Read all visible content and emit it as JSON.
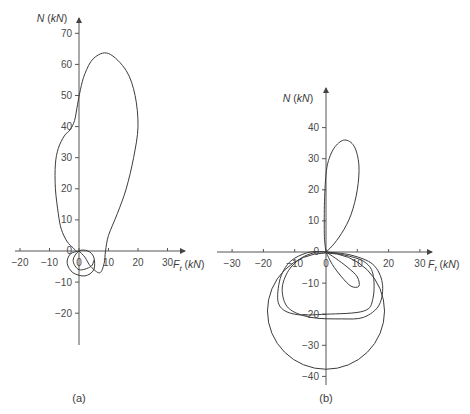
{
  "chart_data": [
    {
      "type": "line",
      "panel_label": "(a)",
      "xlabel": "F_t (kN)",
      "ylabel": "N (kN)",
      "xlim": [
        -20,
        35
      ],
      "ylim": [
        -20,
        73
      ],
      "x_ticks": [
        -20,
        -10,
        0,
        10,
        20,
        30
      ],
      "y_ticks": [
        -20,
        -10,
        10,
        20,
        30,
        40,
        50,
        60,
        70
      ],
      "grid": false,
      "origin_label": "0",
      "series": [
        {
          "name": "main-loop",
          "points": [
            [
              0,
              0
            ],
            [
              2,
              -2
            ],
            [
              4,
              -5
            ],
            [
              7,
              -7
            ],
            [
              8.5,
              -4
            ],
            [
              9,
              0
            ],
            [
              10,
              5
            ],
            [
              13,
              12
            ],
            [
              16,
              20
            ],
            [
              18.5,
              30
            ],
            [
              20,
              40
            ],
            [
              19,
              50
            ],
            [
              16,
              58
            ],
            [
              10,
              63.5
            ],
            [
              5,
              62
            ],
            [
              2,
              57
            ],
            [
              0.5,
              52
            ],
            [
              -0.5,
              47
            ],
            [
              -1.5,
              42
            ],
            [
              -3,
              39
            ],
            [
              -5,
              37
            ],
            [
              -7,
              33
            ],
            [
              -8,
              28
            ],
            [
              -8,
              20
            ],
            [
              -7,
              12
            ],
            [
              -6,
              7
            ],
            [
              -4,
              3
            ],
            [
              -2,
              1
            ],
            [
              -1,
              0
            ]
          ]
        },
        {
          "name": "small-inner-loops",
          "points": [
            [
              0,
              0
            ],
            [
              -3,
              -1
            ],
            [
              -4,
              -4
            ],
            [
              -2,
              -7
            ],
            [
              2,
              -8
            ],
            [
              5,
              -6
            ],
            [
              5,
              -2
            ],
            [
              3,
              0
            ],
            [
              0,
              0
            ],
            [
              -2,
              -3
            ],
            [
              0,
              -6
            ],
            [
              4,
              -5
            ],
            [
              5,
              -3
            ]
          ]
        }
      ]
    },
    {
      "type": "line",
      "panel_label": "(b)",
      "xlabel": "F_t (kN)",
      "ylabel": "N (kN)",
      "xlim": [
        -35,
        35
      ],
      "ylim": [
        -40,
        48
      ],
      "x_ticks": [
        -30,
        -20,
        -10,
        0,
        10,
        20,
        30
      ],
      "y_ticks": [
        -40,
        -30,
        -20,
        -10,
        10,
        20,
        30,
        40
      ],
      "grid": false,
      "origin_label": "0",
      "series": [
        {
          "name": "upper-lobe",
          "points": [
            [
              0,
              0
            ],
            [
              -0.5,
              5
            ],
            [
              -0.5,
              15
            ],
            [
              0,
              25
            ],
            [
              1,
              30
            ],
            [
              3,
              34
            ],
            [
              6,
              36
            ],
            [
              9,
              34
            ],
            [
              10.5,
              28
            ],
            [
              10,
              20
            ],
            [
              8,
              12
            ],
            [
              5,
              6
            ],
            [
              2,
              2
            ],
            [
              0,
              0
            ]
          ]
        },
        {
          "name": "small-lower-lobe",
          "points": [
            [
              0,
              0
            ],
            [
              3,
              -2
            ],
            [
              7,
              -5
            ],
            [
              10,
              -8
            ],
            [
              10.5,
              -11
            ],
            [
              8,
              -11
            ],
            [
              5,
              -8
            ],
            [
              2,
              -4
            ],
            [
              0,
              0
            ]
          ]
        },
        {
          "name": "mid-loop-1",
          "points": [
            [
              0,
              0
            ],
            [
              6,
              -1
            ],
            [
              12,
              -3
            ],
            [
              15,
              -7
            ],
            [
              15,
              -15
            ],
            [
              12,
              -19
            ],
            [
              0,
              -20
            ],
            [
              -10,
              -20
            ],
            [
              -15,
              -17
            ],
            [
              -15,
              -10
            ],
            [
              -13,
              -5
            ],
            [
              -10,
              -2
            ],
            [
              -5,
              0
            ],
            [
              0,
              0
            ]
          ]
        },
        {
          "name": "mid-loop-2",
          "points": [
            [
              0,
              0
            ],
            [
              8,
              -1
            ],
            [
              15,
              -4
            ],
            [
              18,
              -10
            ],
            [
              17,
              -17
            ],
            [
              12,
              -21
            ],
            [
              5,
              -21.5
            ],
            [
              -5,
              -21
            ],
            [
              -12,
              -18
            ],
            [
              -14,
              -12
            ],
            [
              -12,
              -6
            ],
            [
              -8,
              -2
            ],
            [
              -3,
              0
            ],
            [
              0,
              0
            ]
          ]
        },
        {
          "name": "large-circle",
          "shape": "circle",
          "center": [
            0,
            -19
          ],
          "radius": 18.7
        }
      ]
    }
  ]
}
